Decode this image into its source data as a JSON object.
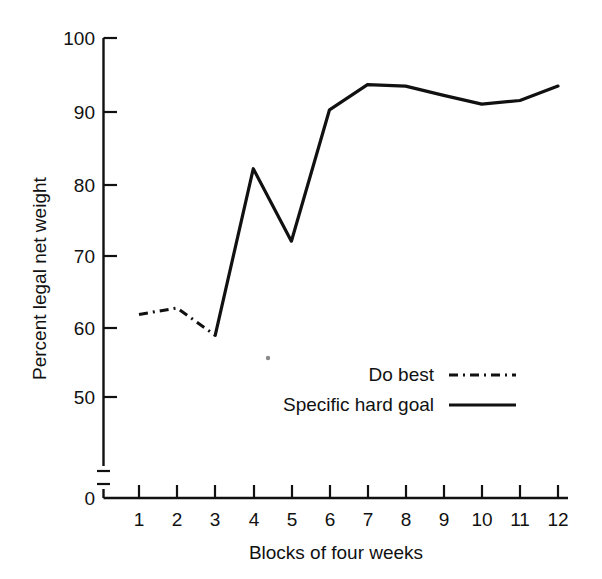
{
  "chart_data": {
    "type": "line",
    "title": "",
    "xlabel": "Blocks of four weeks",
    "ylabel": "Percent legal net weight",
    "x": [
      1,
      2,
      3,
      4,
      5,
      6,
      7,
      8,
      9,
      10,
      11,
      12
    ],
    "xtick_labels": [
      "1",
      "2",
      "3",
      "4",
      "5",
      "6",
      "7",
      "8",
      "9",
      "10",
      "11",
      "12"
    ],
    "ytick_labels": [
      "0",
      "50",
      "60",
      "70",
      "80",
      "90",
      "100"
    ],
    "ytick_values": [
      0,
      50,
      60,
      70,
      80,
      90,
      100
    ],
    "ylim": [
      50,
      100
    ],
    "xlim": [
      1,
      12
    ],
    "grid": false,
    "axis_break": true,
    "axis_break_note": "y-axis broken between 0 and 50",
    "legend_position": "center-right-inside",
    "series": [
      {
        "name": "Do best",
        "style": "dash-dot",
        "x": [
          1,
          2,
          3
        ],
        "values": [
          61.5,
          62.4,
          58.6
        ]
      },
      {
        "name": "Specific hard goal",
        "style": "solid",
        "x": [
          3,
          4,
          5,
          6,
          7,
          8,
          9,
          10,
          11,
          12
        ],
        "values": [
          58.6,
          81.8,
          71.7,
          90.0,
          93.5,
          93.3,
          92.0,
          90.8,
          91.3,
          93.3
        ]
      }
    ]
  },
  "axes": {
    "y_label": "Percent legal net weight",
    "x_label": "Blocks of four weeks",
    "y_ticks": [
      "100",
      "90",
      "80",
      "70",
      "60",
      "50",
      "0"
    ],
    "x_ticks": [
      "1",
      "2",
      "3",
      "4",
      "5",
      "6",
      "7",
      "8",
      "9",
      "10",
      "11",
      "12"
    ]
  },
  "legend": {
    "entries": [
      {
        "label": "Do best",
        "style": "dash-dot"
      },
      {
        "label": "Specific hard goal",
        "style": "solid"
      }
    ]
  }
}
